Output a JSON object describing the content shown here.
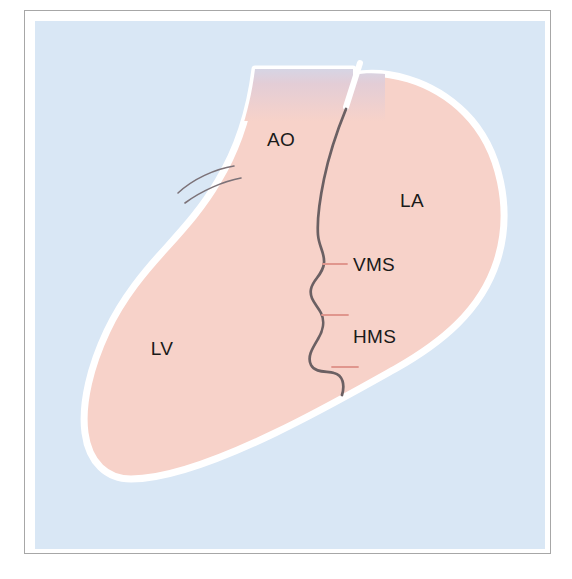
{
  "figure": {
    "type": "medical-anatomy-schematic",
    "frame": {
      "border_color": "#a7a7a7",
      "mat_color": "#ffffff"
    },
    "palette": {
      "background_blue": "#d9e7f5",
      "chamber_pink": "#f7d2c9",
      "chamber_outline_white": "#ffffff",
      "septum_line_gray": "#6b6063",
      "leader_line_pink": "#e8a9a0",
      "label_text": "#1a1a1a",
      "aorta_top_tint": "#e7cfd8"
    },
    "labels": [
      {
        "id": "ao",
        "text": "AO",
        "meaning": "aorta",
        "x": 246,
        "y": 125
      },
      {
        "id": "la",
        "text": "LA",
        "meaning": "left atrium",
        "x": 377,
        "y": 186
      },
      {
        "id": "lv",
        "text": "LV",
        "meaning": "left ventricle",
        "x": 127,
        "y": 334
      },
      {
        "id": "vms",
        "text": "VMS",
        "meaning": "ventriculo-mitral septum",
        "x": 308,
        "y": 248
      },
      {
        "id": "hms",
        "text": "HMS",
        "meaning": "hinge of mitral septum",
        "x": 310,
        "y": 320
      }
    ],
    "leader_ticks": [
      {
        "id": "vms-tick",
        "for": "vms",
        "x1": 288,
        "y1": 243,
        "x2": 310,
        "y2": 243
      },
      {
        "id": "hms-tick-upper",
        "for": "hms",
        "x1": 287,
        "y1": 294,
        "x2": 312,
        "y2": 294
      },
      {
        "id": "hms-tick-lower",
        "for": "hms",
        "x1": 296,
        "y1": 346,
        "x2": 322,
        "y2": 346
      }
    ],
    "features": [
      {
        "id": "aortic-valve-echoes",
        "description": "two fine grey arcs at left aortic wall"
      },
      {
        "id": "interventricular-septum",
        "description": "scalloped grey line dividing AO/LV from LA"
      },
      {
        "id": "aortic-root-gap",
        "description": "white discontinuity at superior aorta"
      }
    ]
  }
}
